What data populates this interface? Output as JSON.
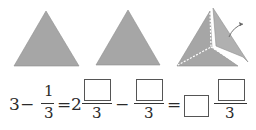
{
  "figures": {
    "triangle_1": {
      "label": "whole triangle",
      "fill": "#a6a6a6"
    },
    "triangle_2": {
      "label": "whole triangle",
      "fill": "#a6a6a6"
    },
    "triangle_3": {
      "label": "triangle cut into thirds with one part removed",
      "fill": "#a6a6a6"
    }
  },
  "equation": {
    "whole": "3",
    "minus_1": "−",
    "frac1_num": "1",
    "frac1_den": "3",
    "equals_1": "=",
    "mixed_whole": "2",
    "frac2_den": "3",
    "minus_2": "−",
    "frac3_den": "3",
    "equals_2": "=",
    "frac4_den": "3"
  },
  "colors": {
    "shape_fill": "#a6a6a6",
    "line": "#333333"
  }
}
